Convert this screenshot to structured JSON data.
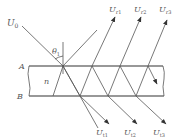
{
  "figure": {
    "incident_label": "U",
    "incident_sub": "0",
    "angle_label": "θ",
    "angle_sub": "1",
    "surface_top_label": "A",
    "surface_bottom_label": "B",
    "medium_label": "n",
    "reflected": [
      {
        "label": "U",
        "sub": "r1"
      },
      {
        "label": "U",
        "sub": "r2"
      },
      {
        "label": "U",
        "sub": "r3"
      }
    ],
    "transmitted": [
      {
        "label": "U",
        "sub": "t1"
      },
      {
        "label": "U",
        "sub": "t2"
      },
      {
        "label": "U",
        "sub": "t3"
      }
    ],
    "colors": {
      "line": "#555555",
      "surface": "#333333",
      "background": "#ffffff"
    }
  }
}
